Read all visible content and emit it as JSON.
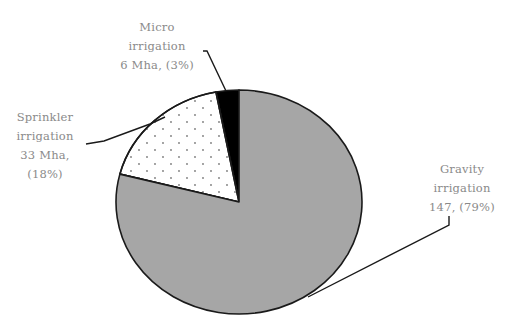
{
  "chart_data": {
    "type": "pie",
    "title": "",
    "unit": "Mha",
    "start_angle_deg": 90,
    "direction": "counterclockwise",
    "slices": [
      {
        "name": "Micro irrigation",
        "value": 6,
        "percent": 3,
        "fill": "#000000",
        "pattern": "solid",
        "label_lines": [
          "Micro",
          "irrigation",
          "6 Mha, (3%)"
        ]
      },
      {
        "name": "Sprinkler irrigation",
        "value": 33,
        "percent": 18,
        "fill": "#ffffff",
        "pattern": "dots",
        "label_lines": [
          "Sprinkler",
          "irrigation",
          "33 Mha,",
          "(18%)"
        ]
      },
      {
        "name": "Gravity irrigation",
        "value": 147,
        "percent": 79,
        "fill": "#a6a6a6",
        "pattern": "solid",
        "label_lines": [
          "Gravity",
          "irrigation",
          "147, (79%)"
        ]
      }
    ],
    "legend": "none (leader-line labels)",
    "layout": {
      "center": [
        239,
        202
      ],
      "rx": 123,
      "ry": 112
    }
  },
  "colors": {
    "outline": "#1a1a1a",
    "label_text": "#8a8a8a",
    "gravity_fill": "#a6a6a6",
    "micro_fill": "#000000",
    "sprinkler_fill": "#ffffff",
    "dot_color": "#7a7a7a"
  }
}
